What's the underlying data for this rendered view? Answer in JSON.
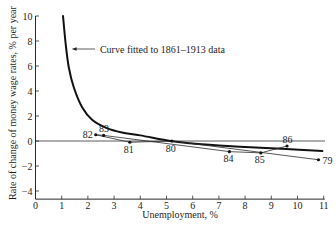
{
  "chart_data": {
    "type": "line",
    "title": "",
    "xlabel": "Unemployment, %",
    "ylabel": "Rate of change of money wage rates, % per year",
    "xlim": [
      0,
      11
    ],
    "ylim": [
      -4.65,
      10
    ],
    "grid": false,
    "legend": null,
    "xticks": [
      0,
      1,
      2,
      3,
      4,
      5,
      6,
      7,
      8,
      9,
      10,
      11
    ],
    "xtick_labels": [
      "0",
      "1",
      "2",
      "3",
      "4",
      "5",
      "6",
      "7",
      "8",
      "9",
      "10",
      "11"
    ],
    "yticks": [
      10,
      8,
      6,
      4,
      2,
      0,
      -2,
      -4
    ],
    "ytick_labels": [
      "10",
      "8",
      "6",
      "4",
      "2",
      "0",
      "−2",
      "−4"
    ],
    "reference_lines": [
      {
        "y": 0,
        "x_from": 0,
        "x_to": 11.05
      }
    ],
    "series": [
      {
        "name": "Curve fitted to 1861–1913 data",
        "type": "curve",
        "points": [
          [
            1.05,
            10.0
          ],
          [
            1.15,
            7.8
          ],
          [
            1.27,
            5.9
          ],
          [
            1.46,
            4.3
          ],
          [
            1.78,
            2.7
          ],
          [
            2.16,
            1.7
          ],
          [
            2.7,
            1.05
          ],
          [
            3.3,
            0.68
          ],
          [
            4.0,
            0.45
          ],
          [
            5.15,
            0.0
          ],
          [
            5.9,
            -0.18
          ],
          [
            7.0,
            -0.35
          ],
          [
            8.2,
            -0.5
          ],
          [
            9.4,
            -0.62
          ],
          [
            10.95,
            -0.8
          ]
        ]
      },
      {
        "name": "",
        "type": "line+markers",
        "points": [
          {
            "label": "79",
            "x": 10.8,
            "y": -1.5,
            "label_pos": "right"
          },
          {
            "label": "80",
            "x": 5.2,
            "y": 0.0,
            "label_pos": "below"
          },
          {
            "label": "81",
            "x": 3.6,
            "y": -0.1,
            "label_pos": "below"
          },
          {
            "label": "82",
            "x": 2.3,
            "y": 0.5,
            "label_pos": "left"
          },
          {
            "label": "83",
            "x": 2.6,
            "y": 0.45,
            "label_pos": "above"
          },
          {
            "label": "84",
            "x": 7.4,
            "y": -0.85,
            "label_pos": "below"
          },
          {
            "label": "85",
            "x": 8.6,
            "y": -0.95,
            "label_pos": "below"
          },
          {
            "label": "86",
            "x": 9.6,
            "y": -0.4,
            "label_pos": "above"
          }
        ]
      }
    ],
    "annotations": [
      {
        "text": "Curve fitted to 1861–1913 data",
        "arrow_tip": {
          "x": 1.38,
          "y": 7.36
        },
        "arrow_tail": {
          "x": 2.27,
          "y": 7.36
        },
        "text_at": {
          "x": 2.46,
          "y": 7.36
        }
      }
    ]
  }
}
